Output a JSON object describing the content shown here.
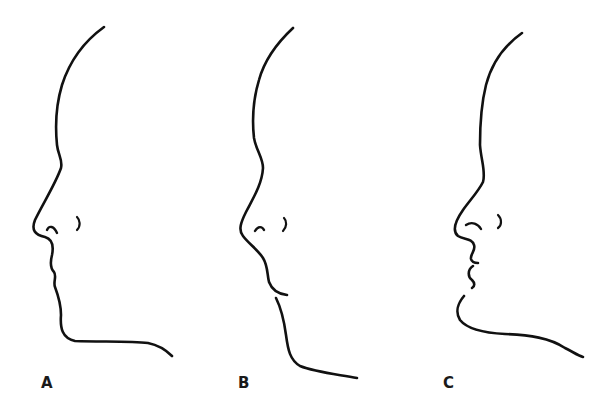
{
  "figure": {
    "background": "#ffffff",
    "stroke_color": "#111111",
    "profiles": [
      {
        "id": "A",
        "label": "A",
        "label_x": 41,
        "strokes": [
          {
            "part": "face-outline",
            "width": 2.6,
            "d": "M104,27 C86,40 70,60 62,85 C56,105 55,125 57,145 C58,155 63,160 61,168 C55,185 42,205 35,220 C31,230 35,235 45,237 C52,239 54,245 52,255 C50,263 50,268 54,272 C57,276 53,282 55,287 C58,295 61,303 61,315 C60,328 62,338 75,341 C100,342 130,341 148,343 C158,345 166,350 172,356"
          },
          {
            "part": "nostril",
            "width": 2.4,
            "d": "M47,230 C49,225 54,226 57,233"
          },
          {
            "part": "ear-mark",
            "width": 2.2,
            "d": "M77,217 C80,220 81,226 77,230"
          }
        ]
      },
      {
        "id": "B",
        "label": "B",
        "label_x": 238,
        "strokes": [
          {
            "part": "face-outline",
            "width": 2.6,
            "d": "M293,28 C278,42 265,58 259,80 C253,100 252,120 254,138 C256,150 263,158 263,168 C262,185 252,200 246,212 C241,222 238,230 243,236 C249,244 258,250 263,258 C268,266 267,274 269,282 C272,290 278,294 287,295"
          },
          {
            "part": "chin-neck",
            "width": 2.6,
            "d": "M276,298 C281,308 284,320 286,335 C288,350 290,360 300,366 C315,372 335,374 357,378"
          },
          {
            "part": "nostril",
            "width": 2.4,
            "d": "M255,231 C258,226 262,226 264,230"
          },
          {
            "part": "ear-mark",
            "width": 2.2,
            "d": "M284,218 C287,221 287,227 283,231"
          }
        ]
      },
      {
        "id": "C",
        "label": "C",
        "label_x": 443,
        "strokes": [
          {
            "part": "face-outline",
            "width": 2.6,
            "d": "M522,33 C505,45 492,62 486,85 C481,105 480,125 480,145 C481,160 486,172 483,182 C478,192 470,200 463,210 C456,220 451,230 458,236 C464,240 472,238 474,245 C476,251 470,254 471,259 C472,263 476,263 478,263"
          },
          {
            "part": "lower-lip",
            "width": 2.6,
            "d": "M473,266 C467,270 468,277 472,280 C475,283 475,286 472,288"
          },
          {
            "part": "chin-neck",
            "width": 2.6,
            "d": "M464,296 C458,303 455,312 460,320 C468,330 485,333 505,334 C530,335 550,338 565,348 C573,352 579,356 583,357"
          },
          {
            "part": "nostril",
            "width": 2.4,
            "d": "M466,225 C472,221 478,224 481,229"
          },
          {
            "part": "ear-mark",
            "width": 2.2,
            "d": "M498,215 C502,219 502,225 498,228"
          }
        ]
      }
    ]
  }
}
